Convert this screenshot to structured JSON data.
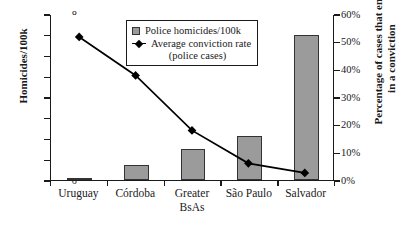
{
  "chart_data": {
    "type": "bar",
    "title": "",
    "categories": [
      "Uruguay",
      "Córdoba",
      "Greater BsAs",
      "São Paulo",
      "Salvador"
    ],
    "category_lines": [
      [
        "Uruguay"
      ],
      [
        "Córdoba"
      ],
      [
        "Greater",
        "BsAs"
      ],
      [
        "São Paulo"
      ],
      [
        "Salvador"
      ]
    ],
    "series": [
      {
        "name": "Police homicides/100k",
        "type": "bar",
        "axis": "left",
        "values": [
          0.1,
          0.7,
          1.5,
          2.1,
          7.0
        ]
      },
      {
        "name": "Average conviction rate (police cases)",
        "type": "line",
        "axis": "right",
        "values": [
          52,
          38,
          18,
          6,
          2.5
        ]
      }
    ],
    "xlabel": "",
    "ylabel": "Homicides/100k",
    "ylabel_right": "Percentage of cases that end in a conviction",
    "ylim": [
      0,
      8
    ],
    "ylim_right": [
      0,
      60
    ],
    "yticks": [
      "0",
      "1",
      "2",
      "3",
      "4",
      "5",
      "6",
      "7",
      "8"
    ],
    "ytick_values": [
      0,
      1,
      2,
      3,
      4,
      5,
      6,
      7,
      8
    ],
    "yticks_right": [
      "0%",
      "10%",
      "20%",
      "30%",
      "40%",
      "50%",
      "60%"
    ],
    "ytick_values_right": [
      0,
      10,
      20,
      30,
      40,
      50,
      60
    ],
    "grid": false,
    "legend_position": "top-center",
    "legend": [
      {
        "label": "Police homicides/100k",
        "marker": "square-swatch",
        "color": "#9b9b9b"
      },
      {
        "label": "Average conviction rate",
        "sublabel": "(police cases)",
        "marker": "line-diamond",
        "color": "#000000"
      }
    ]
  },
  "axes": {
    "left_title": "Homicides/100k",
    "right_title_line1": "Percentage of cases that end",
    "right_title_line2": "in a conviction"
  },
  "colors": {
    "bar_fill": "#9b9b9b",
    "bar_stroke": "#333333",
    "line": "#000000",
    "axis": "#1a1a1a",
    "background": "#ffffff"
  }
}
